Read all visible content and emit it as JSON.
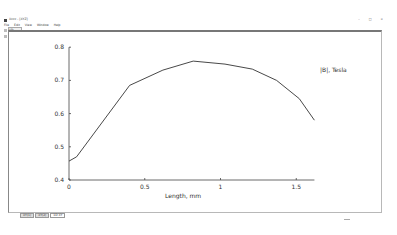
{
  "window": {
    "title": "Xxxx - [XYZ]",
    "controls": [
      "–",
      "□",
      "×"
    ]
  },
  "menubar": {
    "items": [
      "File",
      "Edit",
      "View",
      "Window",
      "Help"
    ]
  },
  "toolbar": {
    "tab_label": "1D"
  },
  "bottom_tabs": [
    {
      "label": "XY(1)",
      "active": false
    },
    {
      "label": "XY(2)",
      "active": false
    },
    {
      "label": "1D XY",
      "active": true
    }
  ],
  "chart_data": {
    "type": "line",
    "title": "",
    "xlabel": "Length, mm",
    "ylabel": "",
    "legend": [
      "|B|, Tesla"
    ],
    "legend_position": "top-right inside plot",
    "grid": false,
    "xlim": [
      0,
      1.62
    ],
    "ylim": [
      0.4,
      0.8
    ],
    "x_ticks": [
      0,
      0.5,
      1,
      1.5
    ],
    "x_tick_labels": [
      "0",
      "0.5",
      "1",
      "1.5"
    ],
    "y_ticks": [
      0.4,
      0.5,
      0.6,
      0.7,
      0.8
    ],
    "y_tick_labels": [
      "0.4",
      "0.5",
      "0.6",
      "0.7",
      "0.8"
    ],
    "series": [
      {
        "name": "|B|, Tesla",
        "color": "#333333",
        "x": [
          0,
          0.05,
          0.4,
          0.62,
          0.82,
          1.03,
          1.21,
          1.37,
          1.52,
          1.62
        ],
        "values": [
          0.457,
          0.47,
          0.685,
          0.731,
          0.758,
          0.749,
          0.734,
          0.7,
          0.645,
          0.58
        ]
      }
    ]
  }
}
